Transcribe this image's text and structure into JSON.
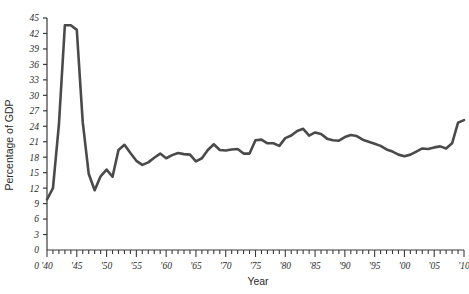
{
  "chart_data": {
    "type": "line",
    "title": "",
    "xlabel": "Year",
    "ylabel": "Percentage of GDP",
    "xlim": [
      1940,
      2010
    ],
    "ylim": [
      0,
      45
    ],
    "grid": false,
    "legend": "none",
    "line_color": "#4a4a4a",
    "axis_color": "#3a3a3a",
    "x_ticks_major": [
      "'40",
      "'45",
      "'50",
      "'55",
      "'60",
      "'65",
      "'70",
      "'75",
      "'80",
      "'85",
      "'90",
      "'95",
      "'00",
      "'05",
      "'10"
    ],
    "x_tick_values": [
      1940,
      1945,
      1950,
      1955,
      1960,
      1965,
      1970,
      1975,
      1980,
      1985,
      1990,
      1995,
      2000,
      2005,
      2010
    ],
    "x_minor_interval": 1,
    "y_ticks": [
      "0",
      "3",
      "6",
      "9",
      "12",
      "15",
      "18",
      "21",
      "24",
      "27",
      "30",
      "33",
      "36",
      "39",
      "42",
      "45"
    ],
    "y_tick_values": [
      0,
      3,
      6,
      9,
      12,
      15,
      18,
      21,
      24,
      27,
      30,
      33,
      36,
      39,
      42,
      45
    ],
    "x": [
      1940,
      1941,
      1942,
      1943,
      1944,
      1945,
      1946,
      1947,
      1948,
      1949,
      1950,
      1951,
      1952,
      1953,
      1954,
      1955,
      1956,
      1957,
      1958,
      1959,
      1960,
      1961,
      1962,
      1963,
      1964,
      1965,
      1966,
      1967,
      1968,
      1969,
      1970,
      1971,
      1972,
      1973,
      1974,
      1975,
      1976,
      1977,
      1978,
      1979,
      1980,
      1981,
      1982,
      1983,
      1984,
      1985,
      1986,
      1987,
      1988,
      1989,
      1990,
      1991,
      1992,
      1993,
      1994,
      1995,
      1996,
      1997,
      1998,
      1999,
      2000,
      2001,
      2002,
      2003,
      2004,
      2005,
      2006,
      2007,
      2008,
      2009,
      2010
    ],
    "values": [
      9.8,
      12.0,
      24.3,
      43.6,
      43.6,
      42.7,
      24.8,
      14.8,
      11.6,
      14.3,
      15.6,
      14.2,
      19.4,
      20.4,
      18.8,
      17.3,
      16.5,
      17.0,
      17.9,
      18.7,
      17.8,
      18.4,
      18.8,
      18.6,
      18.5,
      17.2,
      17.8,
      19.4,
      20.5,
      19.4,
      19.3,
      19.5,
      19.6,
      18.7,
      18.7,
      21.3,
      21.4,
      20.7,
      20.7,
      20.2,
      21.7,
      22.2,
      23.1,
      23.5,
      22.2,
      22.8,
      22.5,
      21.6,
      21.3,
      21.2,
      21.9,
      22.3,
      22.1,
      21.4,
      21.0,
      20.6,
      20.2,
      19.5,
      19.1,
      18.5,
      18.2,
      18.5,
      19.1,
      19.7,
      19.6,
      19.9,
      20.1,
      19.7,
      20.7,
      24.7,
      25.2
    ]
  }
}
